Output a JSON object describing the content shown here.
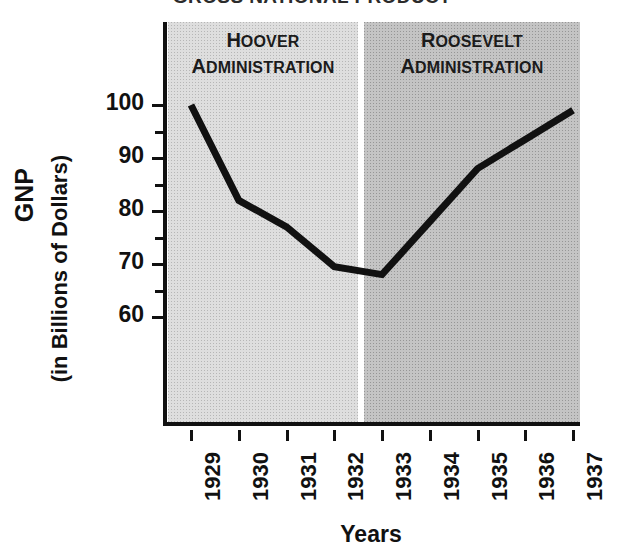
{
  "title": {
    "full": "GROSS NATIONAL PRODUCT",
    "lead": "G",
    "rest": "ROSS ",
    "lead2": "N",
    "rest2": "ATIONAL ",
    "lead3": "P",
    "rest3": "RODUCT"
  },
  "axes": {
    "y_title_line1": "GNP",
    "y_title_line2": "(in Billions of Dollars)",
    "x_title": "Years",
    "y_major_labels": [
      "100",
      "90",
      "80",
      "70",
      "60"
    ],
    "y_minor_values": [
      95,
      85,
      75,
      65
    ],
    "x_labels": [
      "1929",
      "1930",
      "1931",
      "1932",
      "1933",
      "1934",
      "1935",
      "1936",
      "1937"
    ]
  },
  "panels": [
    {
      "id": "hoover",
      "line1_cap": "H",
      "line1_rest": "OOVER",
      "line2_cap": "A",
      "line2_rest": "DMINISTRATION",
      "color": "#dedede",
      "years": [
        "1929",
        "1930",
        "1931",
        "1932"
      ]
    },
    {
      "id": "roosevelt",
      "line1_cap": "R",
      "line1_rest": "OOSEVELT",
      "line2_cap": "A",
      "line2_rest": "DMINISTRATION",
      "color": "#c4c4c4",
      "years": [
        "1933",
        "1934",
        "1935",
        "1936",
        "1937"
      ]
    }
  ],
  "colors": {
    "line": "#111111",
    "axis": "#111111",
    "panel_hoover": "#dedede",
    "panel_roosevelt": "#c4c4c4",
    "divider": "#ffffff",
    "background": "#ffffff"
  },
  "chart_data": {
    "type": "line",
    "title": "GROSS NATIONAL PRODUCT",
    "subtitle": "",
    "xlabel": "Years",
    "ylabel": "GNP (in Billions of Dollars)",
    "x": [
      "1929",
      "1930",
      "1931",
      "1932",
      "1933",
      "1934",
      "1935",
      "1936",
      "1937"
    ],
    "series": [
      {
        "name": "GNP",
        "values": [
          100,
          82,
          77,
          69.5,
          68,
          78,
          88,
          93.5,
          99
        ],
        "color": "#111111"
      }
    ],
    "ylim": [
      54,
      103
    ],
    "y_ticks_major": [
      60,
      70,
      80,
      90,
      100
    ],
    "y_ticks_minor": [
      65,
      75,
      85,
      95
    ],
    "grid": false,
    "legend": "none",
    "annotations": [
      {
        "text": "HOOVER ADMINISTRATION",
        "x_range": [
          "1929",
          "1932"
        ],
        "position": "top"
      },
      {
        "text": "ROOSEVELT ADMINISTRATION",
        "x_range": [
          "1933",
          "1937"
        ],
        "position": "top"
      }
    ]
  }
}
